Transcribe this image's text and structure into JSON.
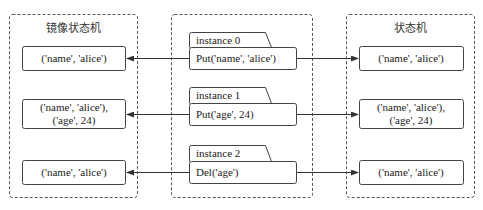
{
  "diagram": {
    "left_panel": {
      "title": "镜像状态机",
      "states": [
        {
          "line1": "('name', 'alice')",
          "line2": ""
        },
        {
          "line1": "('name', 'alice'),",
          "line2": "('age', 24)"
        },
        {
          "line1": "('name', 'alice')",
          "line2": ""
        }
      ]
    },
    "middle_panel": {
      "instances": [
        {
          "tab": "instance 0",
          "op": "Put('name', 'alice')"
        },
        {
          "tab": "instance 1",
          "op": "Put('age', 24)"
        },
        {
          "tab": "instance 2",
          "op": "Del('age')"
        }
      ]
    },
    "right_panel": {
      "title": "状态机",
      "states": [
        {
          "line1": "('name', 'alice')",
          "line2": ""
        },
        {
          "line1": "('name', 'alice'),",
          "line2": "('age', 24)"
        },
        {
          "line1": "('name', 'alice')",
          "line2": ""
        }
      ]
    },
    "colors": {
      "stroke": "#444444",
      "dash": "#555555",
      "background": "#ffffff"
    }
  }
}
